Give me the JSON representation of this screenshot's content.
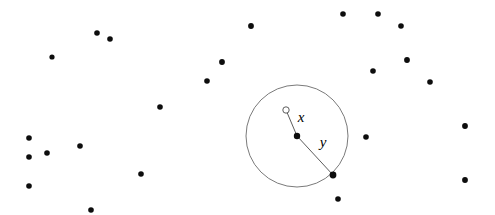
{
  "figure": {
    "width": 495,
    "height": 215,
    "background_color": "#ffffff",
    "point_color": "#0d0d0d",
    "line_color": "#4a4a4a",
    "circle_stroke_color": "#6b6b6b"
  },
  "labels": {
    "x_label": "x",
    "y_label": "y"
  },
  "annotations": [
    {
      "name": "label-x",
      "text": "x",
      "x": 301,
      "y": 119,
      "font_style": "italic"
    },
    {
      "name": "label-y",
      "text": "y",
      "x": 323,
      "y": 144,
      "font_style": "italic"
    }
  ],
  "circle": {
    "name": "query-circle",
    "center_x": 297,
    "center_y": 136,
    "radius": 51,
    "stroke_width": 0.9,
    "fill": "none"
  },
  "open_marker": {
    "name": "query-point-open",
    "x": 286,
    "y": 110,
    "radius": 3.2,
    "stroke_width": 0.9,
    "fill": "#ffffff"
  },
  "segments": [
    {
      "name": "segment-x",
      "x1": 286,
      "y1": 110,
      "x2": 297,
      "y2": 136,
      "stroke_width": 0.9
    },
    {
      "name": "segment-y",
      "x1": 297,
      "y1": 136,
      "x2": 333,
      "y2": 175,
      "stroke_width": 0.9
    }
  ],
  "highlight_points": [
    {
      "name": "center-point",
      "x": 297,
      "y": 136,
      "r": 3.2
    },
    {
      "name": "edge-point",
      "x": 333,
      "y": 175,
      "r": 3.4
    }
  ],
  "scatter_points": [
    {
      "x": 97,
      "y": 33,
      "r": 2.8
    },
    {
      "x": 110,
      "y": 39,
      "r": 2.8
    },
    {
      "x": 52,
      "y": 57,
      "r": 2.6
    },
    {
      "x": 160,
      "y": 107,
      "r": 2.8
    },
    {
      "x": 29,
      "y": 138,
      "r": 2.8
    },
    {
      "x": 29,
      "y": 157,
      "r": 2.8
    },
    {
      "x": 47,
      "y": 153,
      "r": 2.8
    },
    {
      "x": 80,
      "y": 146,
      "r": 2.8
    },
    {
      "x": 29,
      "y": 186,
      "r": 2.8
    },
    {
      "x": 141,
      "y": 174,
      "r": 2.8
    },
    {
      "x": 91,
      "y": 210,
      "r": 2.8
    },
    {
      "x": 251,
      "y": 26,
      "r": 2.9
    },
    {
      "x": 222,
      "y": 62,
      "r": 2.9
    },
    {
      "x": 207,
      "y": 81,
      "r": 2.8
    },
    {
      "x": 343,
      "y": 14,
      "r": 2.8
    },
    {
      "x": 378,
      "y": 14,
      "r": 2.8
    },
    {
      "x": 401,
      "y": 26,
      "r": 2.8
    },
    {
      "x": 407,
      "y": 60,
      "r": 2.9
    },
    {
      "x": 373,
      "y": 71,
      "r": 2.8
    },
    {
      "x": 430,
      "y": 82,
      "r": 2.8
    },
    {
      "x": 366,
      "y": 137,
      "r": 2.8
    },
    {
      "x": 465,
      "y": 126,
      "r": 2.9
    },
    {
      "x": 465,
      "y": 180,
      "r": 2.9
    },
    {
      "x": 338,
      "y": 199,
      "r": 2.8
    }
  ]
}
